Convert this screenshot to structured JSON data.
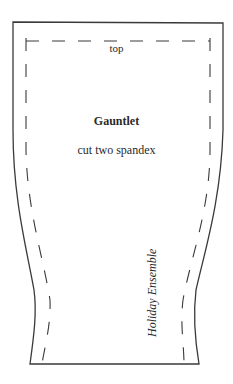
{
  "pattern": {
    "piece_name": "Gauntlet",
    "instructions": "cut two spandex",
    "edge_label": "top",
    "collection_label": "Holiday Ensemble",
    "line_color": "#3a3a3a",
    "background": "#ffffff"
  }
}
